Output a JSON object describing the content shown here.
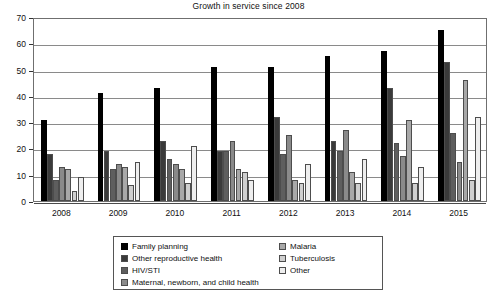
{
  "chart_data": {
    "type": "bar",
    "title": "Growth in service since 2008",
    "xlabel": "",
    "ylabel": "",
    "ylim": [
      0,
      70
    ],
    "ytick_step": 10,
    "yticks": [
      0,
      10,
      20,
      30,
      40,
      50,
      60,
      70
    ],
    "grid": true,
    "legend_position": "below",
    "categories": [
      "2008",
      "2009",
      "2010",
      "2011",
      "2012",
      "2013",
      "2014",
      "2015"
    ],
    "series": [
      {
        "name": "Family planning",
        "color": "#000000",
        "values": [
          31,
          41,
          43,
          51,
          51,
          55,
          57,
          65
        ]
      },
      {
        "name": "Other reproductive health",
        "color": "#3a3a3a",
        "values": [
          18,
          19,
          23,
          19,
          32,
          23,
          43,
          53
        ]
      },
      {
        "name": "HIV/STI",
        "color": "#5e5e5e",
        "values": [
          8,
          12,
          16,
          19,
          18,
          19,
          22,
          26
        ]
      },
      {
        "name": "Maternal, newborn, and child health",
        "color": "#8a8a8a",
        "values": [
          13,
          14,
          14,
          23,
          25,
          27,
          17,
          15
        ]
      },
      {
        "name": "Malaria",
        "color": "#a8a8a8",
        "values": [
          12,
          13,
          12,
          12,
          8,
          11,
          31,
          46
        ]
      },
      {
        "name": "Tuberculosis",
        "color": "#cfcfcf",
        "values": [
          4,
          6,
          7,
          11,
          7,
          7,
          7,
          8
        ]
      },
      {
        "name": "Other",
        "color": "#eeeeee",
        "values": [
          9,
          15,
          21,
          8,
          14,
          16,
          13,
          32
        ]
      }
    ]
  },
  "legend": {
    "columns": [
      [
        "Family planning",
        "Other reproductive health",
        "HIV/STI",
        "Maternal, newborn, and child health"
      ],
      [
        "Malaria",
        "Tuberculosis",
        "Other"
      ]
    ]
  }
}
